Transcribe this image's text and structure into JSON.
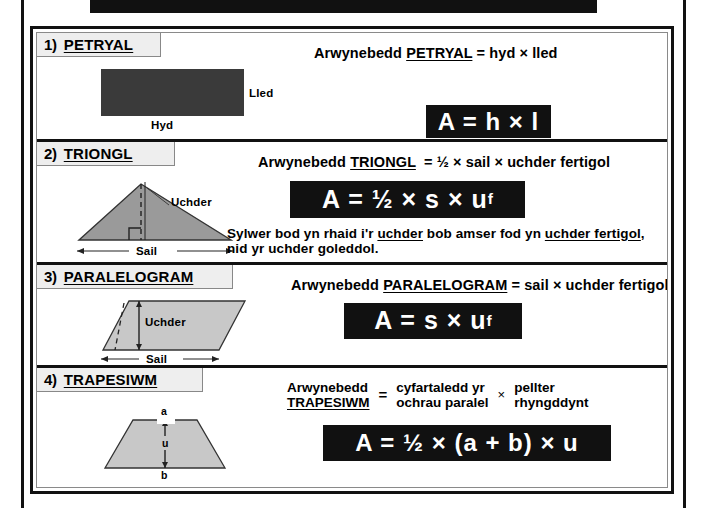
{
  "page": {
    "language": "cy",
    "colors": {
      "frame": "#111111",
      "plate_bg": "#111111",
      "plate_fg": "#ffffff",
      "tab_bg": "#eeeeee",
      "rect_fill": "#3a3a3a",
      "triangle_fill": "#9a9a9a",
      "parallelogram_fill": "#c8c8c8",
      "trapezium_fill": "#c8c8c8"
    }
  },
  "sections": [
    {
      "number": "1)",
      "name": "PETRYAL",
      "headline": {
        "lead": "Arwynebedd",
        "shape": "PETRYAL",
        "equals": "=",
        "expression": "hyd × lled"
      },
      "formula": "A = h × l",
      "diagram": {
        "type": "rectangle",
        "labels": [
          {
            "text": "Lled",
            "role": "width-label"
          },
          {
            "text": "Hyd",
            "role": "length-label"
          }
        ]
      }
    },
    {
      "number": "2)",
      "name": "TRIONGL",
      "headline": {
        "lead": "Arwynebedd",
        "shape": "TRIONGL",
        "equals": "=",
        "expression": "½ × sail × uchder fertigol"
      },
      "formula_prefix": "A = ½ × s × u",
      "formula_sub": "f",
      "note": {
        "line1_a": "Sylwer bod yn rhaid i'r ",
        "line1_u1": "uchder",
        "line1_b": " bob amser fod yn ",
        "line1_u2": "uchder fertigol",
        "line1_c": ",",
        "line2": "nid yr uchder goleddol."
      },
      "diagram": {
        "type": "triangle",
        "labels": [
          {
            "text": "Uchder",
            "role": "height-label"
          },
          {
            "text": "Sail",
            "role": "base-label"
          }
        ]
      }
    },
    {
      "number": "3)",
      "name": "PARALELOGRAM",
      "headline": {
        "lead": "Arwynebedd",
        "shape": "PARALELOGRAM",
        "equals": "=",
        "expression": "sail × uchder fertigol"
      },
      "formula_prefix": "A = s × u",
      "formula_sub": "f",
      "diagram": {
        "type": "parallelogram",
        "labels": [
          {
            "text": "Uchder",
            "role": "height-label"
          },
          {
            "text": "Sail",
            "role": "base-label"
          }
        ]
      }
    },
    {
      "number": "4)",
      "name": "TRAPESIWM",
      "word_equation": {
        "lead_line1": "Arwynebedd",
        "lead_line2": "TRAPESIWM",
        "equals": "=",
        "term1_line1": "cyfartaledd yr",
        "term1_line2": "ochrau paralel",
        "times": "×",
        "term2_line1": "pellter",
        "term2_line2": "rhyngddynt"
      },
      "formula": "A = ½ × (a + b) × u",
      "diagram": {
        "type": "trapezium",
        "labels": [
          {
            "text": "a",
            "role": "top-side-label"
          },
          {
            "text": "u",
            "role": "height-label"
          },
          {
            "text": "b",
            "role": "bottom-side-label"
          }
        ]
      }
    }
  ]
}
